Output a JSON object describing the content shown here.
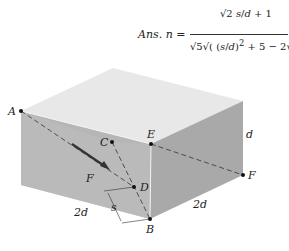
{
  "equation": {
    "lhs": "Ans. n =",
    "numerator": "√2 s/d + 1",
    "denominator": "√5 √((s/d)² + 5 − 2√2 s/d)",
    "num_parts": {
      "sqrt2": "√2",
      "frac_s": "s",
      "frac_d": "d",
      "plus1": "+ 1"
    },
    "den_parts": {
      "sqrt5": "√5",
      "s": "s",
      "d": "d",
      "sq": "2",
      "plus5": "+ 5 − 2√2",
      "s2": "s",
      "d2": "d"
    }
  },
  "figure": {
    "points": {
      "A": "A",
      "B": "B",
      "C": "C",
      "D": "D",
      "E": "E",
      "F": "F"
    },
    "force_label": "F",
    "dimensions": {
      "depth": "2d",
      "width": "2d",
      "height": "d",
      "offset": "s"
    },
    "colors": {
      "top_face": "#e6e6e6",
      "front_left_face": "#b4b4b4",
      "right_face": "#a8a8a8",
      "inner_shade": "#c4c4c4",
      "line": "#333333"
    }
  }
}
